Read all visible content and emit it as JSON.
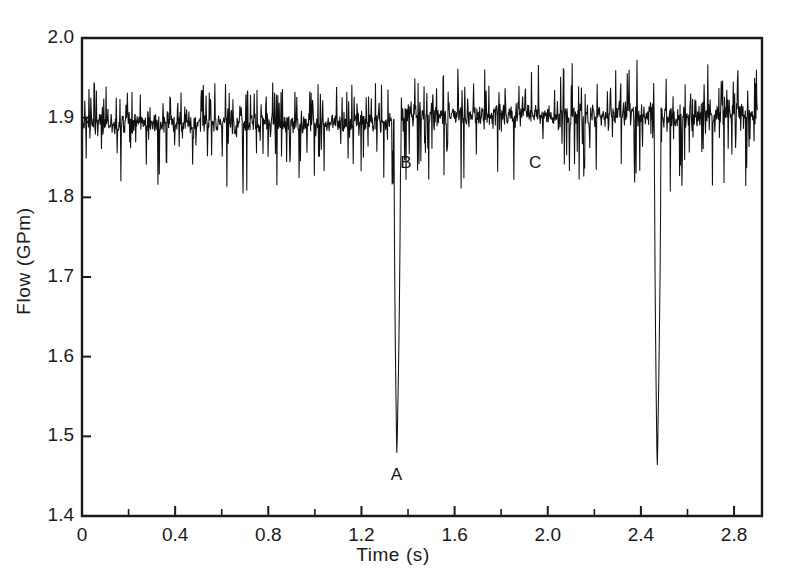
{
  "figure": {
    "background": "#ffffff",
    "line_color": "#101010",
    "axis_color": "#1a1a1a"
  },
  "chart_data": {
    "type": "line",
    "title": "",
    "xlabel": "Time (s)",
    "ylabel": "Flow (GPm)",
    "xlim": [
      0,
      2.92
    ],
    "ylim": [
      1.4,
      2.0
    ],
    "grid": false,
    "legend": null,
    "x_ticks": [
      0,
      0.4,
      0.8,
      1.2,
      1.6,
      2.0,
      2.4,
      2.8
    ],
    "x_tick_labels": [
      "0",
      "0.4",
      "0.8",
      "1.2",
      "1.6",
      "2.0",
      "2.4",
      "2.8"
    ],
    "x_minor_tick_step": 0.2,
    "y_ticks": [
      1.4,
      1.5,
      1.6,
      1.7,
      1.8,
      1.9,
      2.0
    ],
    "y_tick_labels": [
      "1.4",
      "1.5",
      "1.6",
      "1.7",
      "1.8",
      "1.9",
      "2.0"
    ],
    "series": [
      {
        "name": "flow",
        "description": "High-frequency noisy flow signal with two deep downward transient spikes",
        "baseline_before_spike1": 1.893,
        "baseline_after_spike1": 1.903,
        "noise_amplitude_before": 0.045,
        "noise_amplitude_after": 0.052,
        "sample_count": 1460,
        "x_start": 0.0,
        "x_end": 2.9
      }
    ],
    "events": [
      {
        "label": "A",
        "time": 1.352,
        "value": 1.47,
        "kind": "spike-minimum",
        "label_x": 1.352,
        "label_y": 1.452
      },
      {
        "label": "B",
        "time": 1.385,
        "value": 1.855,
        "kind": "recovery-point",
        "label_x": 1.392,
        "label_y": 1.843
      },
      {
        "label": "C",
        "time": 1.945,
        "value": 1.855,
        "kind": "steady-point",
        "label_x": 1.945,
        "label_y": 1.843
      }
    ],
    "spikes": [
      {
        "time": 1.352,
        "min_value": 1.47
      },
      {
        "time": 2.47,
        "min_value": 1.455
      }
    ]
  },
  "cropped_header_text": "· ·  ·  ·   ·  · ·  · ·"
}
